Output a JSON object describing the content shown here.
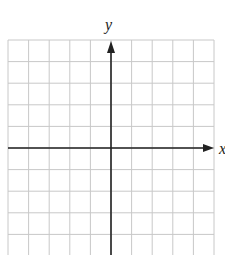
{
  "diagram": {
    "type": "coordinate-plane",
    "x_axis_label": "x",
    "y_axis_label": "y",
    "grid": {
      "columns": 10,
      "rows_above_x_axis": 5,
      "rows_below_x_axis": 5,
      "columns_left_of_y_axis": 5,
      "columns_right_of_y_axis": 5,
      "line_color": "#c8c8c8",
      "axis_color": "#222222"
    }
  }
}
